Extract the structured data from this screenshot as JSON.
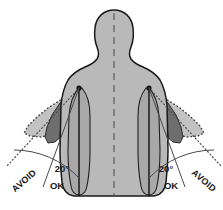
{
  "colors": {
    "background": "#ffffff",
    "body_fill": "#b9b9b9",
    "body_stroke": "#1a1a1a",
    "arm_neutral_fill": "#a8a8a8",
    "arm_mid_fill": "#6e6e6e",
    "arm_dark_fill": "#565656",
    "fan_outer_fill": "#c2c2c2",
    "dotted_stroke": "#3a3a3a",
    "guide_stroke": "#4a4a4a",
    "label_color": "#1a1a1a",
    "centerline_color": "#555555"
  },
  "labels": {
    "left": {
      "avoid": "AVOID",
      "angle": "20°",
      "ok": "OK"
    },
    "right": {
      "avoid": "AVOID",
      "angle": "20°",
      "ok": "OK"
    }
  },
  "geometry": {
    "width": 223,
    "height": 210,
    "left_pivot": {
      "x": 79,
      "y": 88
    },
    "right_pivot": {
      "x": 149,
      "y": 88
    },
    "centerline_x": 114,
    "ok_limit_degrees": 20,
    "avoid_beyond_degrees": 20
  }
}
